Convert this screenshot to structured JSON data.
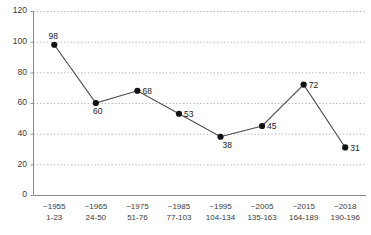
{
  "chart_data": {
    "type": "line",
    "title": "",
    "subtitle": "",
    "xlabel": "",
    "ylabel": "",
    "ylim": [
      0,
      120
    ],
    "ytick_labels": [
      "0",
      "20",
      "40",
      "60",
      "80",
      "100",
      "120"
    ],
    "ytick_values": [
      0,
      20,
      40,
      60,
      80,
      100,
      120
    ],
    "grid": "horizontal-dotted",
    "legend": "none",
    "categories": [
      "~1955",
      "~1965",
      "~1975",
      "~1985",
      "~1995",
      "~2005",
      "~2015",
      "~2018"
    ],
    "category_sublabels": [
      "1-23",
      "24-50",
      "51-76",
      "77-103",
      "104-134",
      "135-163",
      "164-189",
      "190-196"
    ],
    "values": [
      98,
      60,
      68,
      53,
      38,
      45,
      72,
      31
    ],
    "point_labels": [
      "98",
      "60",
      "68",
      "53",
      "38",
      "45",
      "72",
      "31"
    ],
    "label_positions": [
      "above-left",
      "below",
      "right",
      "right",
      "below-right",
      "right",
      "right",
      "right"
    ],
    "marker": "filled-circle",
    "line_color": "#4a4a4a",
    "marker_color": "#111111",
    "grid_color": "#9aa6c4",
    "axis_color": "#888888"
  },
  "footer": {
    "cut_off_caption": ""
  }
}
